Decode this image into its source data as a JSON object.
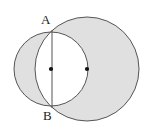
{
  "figure": {
    "type": "geometry-diagram",
    "width": 150,
    "height": 133,
    "background_color": "#ffffff"
  },
  "colors": {
    "shade_fill": "#e0e0e0",
    "overlap_fill": "#ffffff",
    "stroke": "#555555",
    "label_color": "#1a1a1a",
    "center_dot_color": "#111111"
  },
  "labels": {
    "point_a": "A",
    "point_b": "B"
  },
  "chart_data": {
    "type": "diagram",
    "title": "",
    "shapes": [
      {
        "name": "left-circle",
        "kind": "circle",
        "cx": 51,
        "cy": 69,
        "r": 37,
        "filled": true
      },
      {
        "name": "right-circle",
        "kind": "circle",
        "cx": 87,
        "cy": 69,
        "r": 52,
        "filled": true
      },
      {
        "name": "chord-ab",
        "kind": "segment",
        "x1": 52,
        "y1": 30,
        "x2": 52,
        "y2": 108
      }
    ],
    "points": [
      {
        "name": "A",
        "label": "A",
        "x": 52,
        "y": 30
      },
      {
        "name": "B",
        "label": "B",
        "x": 52,
        "y": 108
      },
      {
        "name": "left-center",
        "label": "",
        "x": 51,
        "y": 69
      },
      {
        "name": "right-center",
        "label": "",
        "x": 87,
        "y": 69
      }
    ],
    "shading": "symmetric-difference"
  }
}
